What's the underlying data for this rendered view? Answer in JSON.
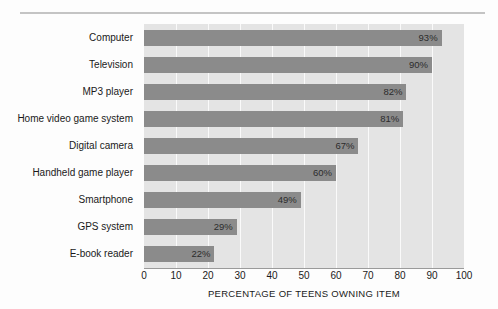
{
  "chart_data": {
    "type": "bar",
    "orientation": "horizontal",
    "title": "",
    "xlabel": "PERCENTAGE OF TEENS OWNING ITEM",
    "ylabel": "",
    "xlim": [
      0,
      100
    ],
    "grid": true,
    "legend": false,
    "categories": [
      "Computer",
      "Television",
      "MP3 player",
      "Home video game system",
      "Digital camera",
      "Handheld game player",
      "Smartphone",
      "GPS system",
      "E-book reader"
    ],
    "values": [
      93,
      90,
      82,
      81,
      67,
      60,
      49,
      29,
      22
    ],
    "value_labels": [
      "93%",
      "90%",
      "82%",
      "81%",
      "67%",
      "60%",
      "49%",
      "29%",
      "22%"
    ],
    "xticks": [
      0,
      10,
      20,
      30,
      40,
      50,
      60,
      70,
      80,
      90,
      100
    ],
    "xtick_labels": [
      "0",
      "10",
      "20",
      "30",
      "40",
      "50",
      "60",
      "70",
      "80",
      "90",
      "100"
    ],
    "colors": {
      "bar": "#8b8b8b",
      "plot_background": "#e4e4e4",
      "gridline": "#fafafa",
      "axis": "#9a9a9a",
      "text": "#1a1a1a",
      "rule": "#c4c4c4"
    }
  }
}
